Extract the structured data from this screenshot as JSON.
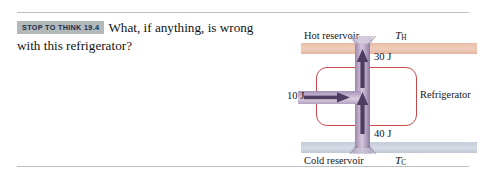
{
  "exercise": {
    "badge": "STOP TO THINK 19.4",
    "question_line1": "What, if anything, is wrong",
    "question_line2": "with this refrigerator?"
  },
  "diagram": {
    "hot_reservoir_label": "Hot reservoir",
    "cold_reservoir_label": "Cold reservoir",
    "temp_hot_symbol": "T",
    "temp_hot_subscript": "H",
    "temp_cold_symbol": "T",
    "temp_cold_subscript": "C",
    "device_label": "Refrigerator",
    "energy_to_hot": "30 J",
    "energy_from_cold": "40 J",
    "work_input": "10 J",
    "colors": {
      "hot_band": "#e9bda8",
      "cold_band": "#c4ccd8",
      "device_outline": "#c8494b",
      "energy_pipe": "#b5a3c2",
      "arrow": "#4a3a5c",
      "rule": "#b9c0c6",
      "badge_bg": "#b3b8ba",
      "badge_text": "#14304d"
    }
  }
}
